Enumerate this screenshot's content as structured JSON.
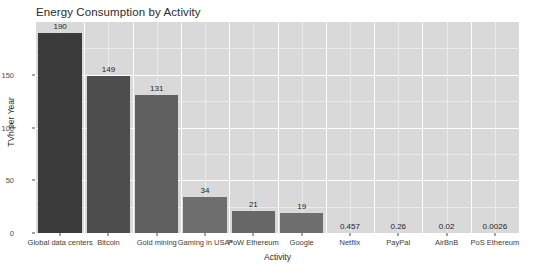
{
  "chart_data": {
    "type": "bar",
    "title": "Energy Consumption by Activity",
    "xlabel": "Activity",
    "ylabel": "TVh per Year",
    "categories": [
      "Global data centers",
      "Bitcoin",
      "Gold mining",
      "Gaming in USA*",
      "PoW Ethereum",
      "Google",
      "Netflix",
      "PayPal",
      "AirBnB",
      "PoS Ethereum"
    ],
    "values": [
      190,
      149,
      131,
      34,
      21,
      19,
      0.457,
      0.26,
      0.02,
      0.0026
    ],
    "value_labels": [
      "190",
      "149",
      "131",
      "34",
      "21",
      "19",
      "0.457",
      "0.26",
      "0.02",
      "0.0026"
    ],
    "bar_colors": [
      "#3b3b3b",
      "#4d4d4d",
      "#606060",
      "#6e6e6e",
      "#676767",
      "#6e6e6e",
      "#7d7d7d",
      "#7d7d7d",
      "#7d7d7d",
      "#7d7d7d"
    ],
    "ylim": [
      0,
      200
    ],
    "y_ticks": [
      0,
      50,
      100,
      150
    ],
    "y_tick_labels": [
      "0",
      "50",
      "100",
      "150"
    ],
    "y_minor_ticks": [
      25,
      75,
      125,
      175
    ],
    "grid": true,
    "legend": "none",
    "panel_color": "#d9d9d9",
    "grid_color": "#ffffff",
    "background_color": "#ffffff"
  }
}
